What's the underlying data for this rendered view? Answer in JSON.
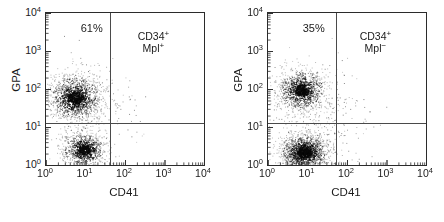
{
  "figure": {
    "panels": [
      {
        "id": "left",
        "percent_label": "61%",
        "quadrant_label_line1": "CD34",
        "quadrant_label_sup1": "+",
        "quadrant_label_line2": "Mpl",
        "quadrant_label_sup2": "+",
        "xlabel": "CD41",
        "ylabel": "GPA"
      },
      {
        "id": "right",
        "percent_label": "35%",
        "quadrant_label_line1": "CD34",
        "quadrant_label_sup1": "+",
        "quadrant_label_line2": "Mpl",
        "quadrant_label_sup2": "−",
        "xlabel": "CD41",
        "ylabel": "GPA"
      }
    ],
    "axis_ticks": {
      "x": [
        "10",
        "10",
        "10",
        "10",
        "10"
      ],
      "x_exponents": [
        "0",
        "1",
        "2",
        "3",
        "4"
      ],
      "y": [
        "10",
        "10",
        "10",
        "10",
        "10"
      ],
      "y_exponents": [
        "0",
        "1",
        "2",
        "3",
        "4"
      ]
    }
  },
  "chart_data": [
    {
      "type": "scatter",
      "title": "",
      "panel": "left",
      "xlabel": "CD41",
      "ylabel": "GPA",
      "xscale": "log",
      "yscale": "log",
      "xlim": [
        1,
        10000
      ],
      "ylim": [
        1,
        10000
      ],
      "xtick_labels": [
        "10^0",
        "10^1",
        "10^2",
        "10^3",
        "10^4"
      ],
      "ytick_labels": [
        "10^0",
        "10^1",
        "10^2",
        "10^3",
        "10^4"
      ],
      "grid": false,
      "legend": "none",
      "annotations": [
        {
          "text": "61%",
          "x": 6,
          "y": 4000,
          "quadrant": "upper-left"
        },
        {
          "text": "CD34+ Mpl+",
          "x": 600,
          "y": 1800,
          "quadrant": "upper-right"
        }
      ],
      "quadrant_gate": {
        "x_divider": 42,
        "y_divider": 13
      },
      "quadrant_percentages": {
        "upper_left": 61
      },
      "clusters": [
        {
          "name": "GPA-positive",
          "n": 1400,
          "center_x": 5.5,
          "center_y": 60,
          "spread_x_log": 0.33,
          "spread_y_log": 0.3
        },
        {
          "name": "GPA-negative",
          "n": 900,
          "center_x": 9.0,
          "center_y": 2.6,
          "spread_x_log": 0.27,
          "spread_y_log": 0.22
        },
        {
          "name": "sparse-background",
          "n": 260,
          "center_x": 12,
          "center_y": 20,
          "spread_x_log": 0.62,
          "spread_y_log": 0.75
        }
      ]
    },
    {
      "type": "scatter",
      "title": "",
      "panel": "right",
      "xlabel": "CD41",
      "ylabel": "GPA",
      "xscale": "log",
      "yscale": "log",
      "xlim": [
        1,
        10000
      ],
      "ylim": [
        1,
        10000
      ],
      "xtick_labels": [
        "10^0",
        "10^1",
        "10^2",
        "10^3",
        "10^4"
      ],
      "ytick_labels": [
        "10^0",
        "10^1",
        "10^2",
        "10^3",
        "10^4"
      ],
      "grid": false,
      "legend": "none",
      "annotations": [
        {
          "text": "35%",
          "x": 6,
          "y": 4000,
          "quadrant": "upper-left"
        },
        {
          "text": "CD34+ Mpl−",
          "x": 600,
          "y": 1800,
          "quadrant": "upper-right"
        }
      ],
      "quadrant_gate": {
        "x_divider": 52,
        "y_divider": 13
      },
      "quadrant_percentages": {
        "upper_left": 35
      },
      "clusters": [
        {
          "name": "GPA-positive",
          "n": 1100,
          "center_x": 7.0,
          "center_y": 95,
          "spread_x_log": 0.3,
          "spread_y_log": 0.27
        },
        {
          "name": "GPA-negative",
          "n": 1600,
          "center_x": 8.0,
          "center_y": 2.2,
          "spread_x_log": 0.3,
          "spread_y_log": 0.24
        },
        {
          "name": "sparse-background",
          "n": 300,
          "center_x": 16,
          "center_y": 16,
          "spread_x_log": 0.66,
          "spread_y_log": 0.78
        }
      ]
    }
  ]
}
